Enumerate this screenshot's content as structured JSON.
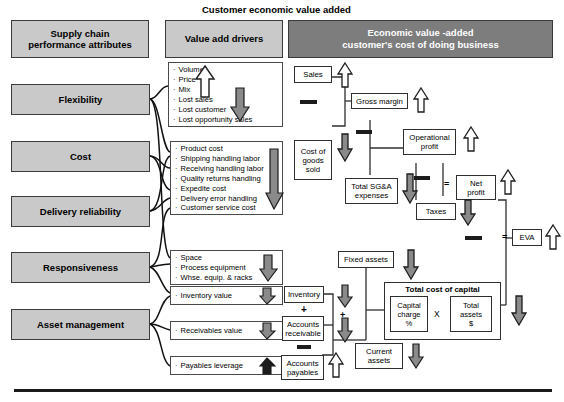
{
  "title": "Customer economic value added",
  "colors": {
    "header_gray": "#c9c9c9",
    "header_dark": "#7d7d7d",
    "arrow_gray": "#8a8a8a",
    "arrow_black": "#1c1c1c",
    "arrow_white": "#ffffff",
    "border": "#3a3a3a"
  },
  "columns": {
    "attributes_header": "Supply chain\nperformance attributes",
    "attributes_header_line1": "Supply chain",
    "attributes_header_line2": "performance attributes",
    "drivers_header": "Value add drivers",
    "eva_header_line1": "Economic value -added",
    "eva_header_line2": "customer's cost of doing business"
  },
  "attributes": [
    {
      "label": "Flexibility"
    },
    {
      "label": "Cost"
    },
    {
      "label": "Delivery reliability"
    },
    {
      "label": "Responsiveness"
    },
    {
      "label": "Asset management"
    }
  ],
  "driver_groups": [
    {
      "name": "sales-drivers",
      "items": [
        "Volume",
        "Price",
        "Mix",
        "Lost sales",
        "Lost customer",
        "Lost opportunity sales"
      ],
      "arrows": [
        {
          "direction": "up",
          "fill": "white"
        },
        {
          "direction": "down",
          "fill": "gray"
        }
      ]
    },
    {
      "name": "cost-drivers",
      "items": [
        "Product cost",
        "Shipping handling labor",
        "Receiving handling labor",
        "Quality returns handling",
        "Expedite cost",
        "Delivery error handling",
        "Customer service cost"
      ],
      "arrows": [
        {
          "direction": "down",
          "fill": "gray"
        }
      ]
    },
    {
      "name": "fixed-asset-drivers",
      "items": [
        "Space",
        "Process equipment",
        "Whse. equip. & racks"
      ],
      "arrows": [
        {
          "direction": "down",
          "fill": "gray"
        }
      ]
    },
    {
      "name": "inventory-drivers",
      "items": [
        "Inventory value"
      ],
      "arrows": [
        {
          "direction": "down",
          "fill": "gray"
        }
      ]
    },
    {
      "name": "receivables-drivers",
      "items": [
        "Receivables value"
      ],
      "arrows": [
        {
          "direction": "down",
          "fill": "gray"
        }
      ]
    },
    {
      "name": "payables-drivers",
      "items": [
        "Payables leverage"
      ],
      "arrows": [
        {
          "direction": "up",
          "fill": "black"
        }
      ]
    }
  ],
  "financials": {
    "sales": "Sales",
    "cost_of_goods_sold": "Cost of\ngoods\nsold",
    "cost_of_goods_sold_l1": "Cost of",
    "cost_of_goods_sold_l2": "goods",
    "cost_of_goods_sold_l3": "sold",
    "gross_margin": "Gross margin",
    "operational_profit_l1": "Operational",
    "operational_profit_l2": "profit",
    "total_sga_l1": "Total SG&A",
    "total_sga_l2": "expenses",
    "taxes": "Taxes",
    "net_profit_l1": "Net",
    "net_profit_l2": "profit",
    "eva": "EVA",
    "fixed_assets": "Fixed assets",
    "inventory": "Inventory",
    "accounts_receivable_l1": "Accounts",
    "accounts_receivable_l2": "receivable",
    "accounts_payable_l1": "Accounts",
    "accounts_payable_l2": "payables",
    "current_assets_l1": "Current",
    "current_assets_l2": "assets",
    "total_cost_of_capital": "Total cost of capital",
    "capital_charge_l1": "Capital",
    "capital_charge_l2": "charge",
    "capital_charge_l3": "%",
    "total_assets_l1": "Total",
    "total_assets_l2": "assets",
    "total_assets_l3": "$",
    "multiply_symbol": "X",
    "plus_symbol_inventory": "+",
    "plus_symbol_current": "+",
    "equals_symbol_net_profit": "=",
    "equals_symbol_eva": "="
  }
}
